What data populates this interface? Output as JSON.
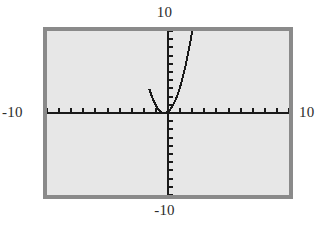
{
  "figure": {
    "name": "graphing-calculator-viewport",
    "background_color": "#ffffff",
    "screen_fill": "#e7e7e7",
    "frame_color": "#8a8a8a",
    "ink_color": "#1a1a1a"
  },
  "labels": {
    "top": "10",
    "bottom": "-10",
    "left": "-10",
    "right": "10"
  },
  "chart_data": {
    "type": "line",
    "title": "",
    "xlabel": "",
    "ylabel": "",
    "xlim": [
      -10,
      10
    ],
    "ylim": [
      -10,
      10
    ],
    "grid": false,
    "legend": "none",
    "axes": {
      "x_axis_at_y": 0,
      "y_axis_at_x": 0,
      "x_tick_step": 1,
      "y_tick_step": 1,
      "x_ticks": [
        -10,
        -9,
        -8,
        -7,
        -6,
        -5,
        -4,
        -3,
        -2,
        -1,
        1,
        2,
        3,
        4,
        5,
        6,
        7,
        8,
        9,
        10
      ],
      "y_ticks": [
        -10,
        -9,
        -8,
        -7,
        -6,
        -5,
        -4,
        -3,
        -2,
        -1,
        1,
        2,
        3,
        4,
        5,
        6,
        7,
        8,
        9,
        10
      ],
      "tick_labels_shown": false,
      "corner_labels": [
        "10",
        "-10",
        "-10",
        "10"
      ]
    },
    "series": [
      {
        "name": "parabola",
        "shape": "upward parabola",
        "vertex": [
          -0.3,
          0
        ],
        "x": [
          -1.6,
          -1.5,
          -1.4,
          -1.3,
          -1.2,
          -1.1,
          -1.0,
          -0.9,
          -0.8,
          -0.7,
          -0.6,
          -0.5,
          -0.4,
          -0.3,
          -0.2,
          -0.1,
          0.0,
          0.1,
          0.2,
          0.3,
          0.4,
          0.5,
          0.6,
          0.7,
          0.8,
          0.9,
          1.0,
          1.1,
          1.2,
          1.3,
          1.4,
          1.5,
          1.6,
          1.7,
          1.8,
          1.9,
          2.0,
          2.1,
          2.2,
          2.3,
          2.4,
          2.5,
          2.6,
          2.7,
          2.8,
          2.9,
          3.0
        ],
        "y": [
          9.83,
          8.64,
          7.5,
          6.4,
          9.0,
          5.12,
          3.43,
          2.7,
          2.03,
          1.44,
          0.81,
          0.24,
          0.01,
          0.0,
          0.12,
          0.32,
          0.54,
          0.77,
          1.05,
          1.36,
          1.69,
          2.05,
          2.43,
          2.84,
          3.27,
          3.73,
          4.21,
          4.72,
          5.25,
          5.8,
          6.38,
          6.98,
          7.61,
          8.26,
          8.93,
          9.63,
          10.0,
          10.0,
          10.0,
          10.0,
          10.0,
          10.0,
          10.0,
          10.0,
          10.0,
          10.0,
          10.0
        ],
        "x_range_visible": [
          -1.55,
          2.0
        ],
        "exits_top_at_x": [
          -1.55,
          2.0
        ],
        "stroke_color": "#1a1a1a",
        "stroke_width": 2,
        "rendering": "pixelated / aliased stair-step"
      }
    ]
  }
}
